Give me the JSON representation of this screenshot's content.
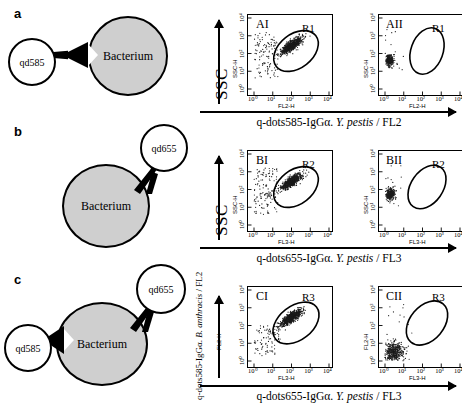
{
  "figure": {
    "panels": [
      {
        "letter": "a",
        "schematic": {
          "bacterium_label": "Bacterium",
          "qdots": [
            "qd585"
          ]
        },
        "y_axis_banner": "SSC",
        "y_axis_name": "SSC-H",
        "x_axis_caption": {
          "prefix": "q-dots585-IgG",
          "alpha": "α",
          "sep": ". ",
          "organism": "Y. pestis",
          "suffix": " / FL2"
        },
        "x_axis_name": "FL2-H",
        "ticks": [
          "10⁰",
          "10¹",
          "10²",
          "10³",
          "10⁴"
        ],
        "plots": [
          {
            "label": "AI",
            "gate": "R2",
            "gate_name_display": "R1",
            "populated": true
          },
          {
            "label": "AII",
            "gate": "R1",
            "gate_name_display": "R1",
            "populated": false
          }
        ]
      },
      {
        "letter": "b",
        "schematic": {
          "bacterium_label": "Bacterium",
          "qdots": [
            "qd655"
          ]
        },
        "y_axis_banner": "SSC",
        "y_axis_name": "SSC-H",
        "x_axis_caption": {
          "prefix": "q-dots655-IgG",
          "alpha": "α",
          "sep": ". ",
          "organism": "Y. pestis",
          "suffix": " / FL3"
        },
        "x_axis_name": "FL3-H",
        "ticks": [
          "10⁰",
          "10¹",
          "10²",
          "10³",
          "10⁴"
        ],
        "plots": [
          {
            "label": "BI",
            "gate": "R2",
            "gate_name_display": "R2",
            "populated": true
          },
          {
            "label": "BII",
            "gate": "R2",
            "gate_name_display": "R2",
            "populated": false
          }
        ]
      },
      {
        "letter": "c",
        "schematic": {
          "bacterium_label": "Bacterium",
          "qdots": [
            "qd585",
            "qd655"
          ]
        },
        "y_axis_banner_parts": {
          "prefix": "q-dots585-IgG",
          "alpha": "α",
          "sep": ". ",
          "organism": "B. anthracis",
          "suffix": " / FL2"
        },
        "y_axis_name": "FL2-H",
        "x_axis_caption": {
          "prefix": "q-dots655-IgG",
          "alpha": "α",
          "sep": ". ",
          "organism": "Y. pestis",
          "suffix": " / FL3"
        },
        "x_axis_name": "FL3-H",
        "ticks": [
          "10⁰",
          "10¹",
          "10²",
          "10³",
          "10⁴"
        ],
        "plots": [
          {
            "label": "CI",
            "gate": "R3",
            "gate_name_display": "R3",
            "populated": true
          },
          {
            "label": "CII",
            "gate": "R3",
            "gate_name_display": "R3",
            "populated": false
          }
        ]
      }
    ]
  },
  "chart_data": {
    "type": "scatter",
    "axis_scale": "log",
    "xlim": [
      1,
      10000
    ],
    "ylim": [
      1,
      10000
    ],
    "tick_labels": [
      "10⁰",
      "10¹",
      "10²",
      "10³",
      "10⁴"
    ],
    "grid": false,
    "legend": "none",
    "plots": [
      {
        "id": "AI",
        "xlabel": "FL2-H",
        "ylabel": "SSC-H",
        "gate": "R1",
        "gate_center_log": [
          2.1,
          2.5
        ],
        "main_cluster_log_center": [
          2.0,
          2.45
        ],
        "main_cluster_points": 620,
        "background_points": 120,
        "gate_populated": true
      },
      {
        "id": "AII",
        "xlabel": "FL2-H",
        "ylabel": "SSC-H",
        "gate": "R1",
        "gate_center_log": [
          2.1,
          2.5
        ],
        "main_cluster_log_center": [
          0.25,
          1.6
        ],
        "main_cluster_points": 260,
        "background_points": 15,
        "gate_populated": false
      },
      {
        "id": "BI",
        "xlabel": "FL3-H",
        "ylabel": "SSC-H",
        "gate": "R2",
        "gate_center_log": [
          2.1,
          2.5
        ],
        "main_cluster_log_center": [
          2.0,
          2.45
        ],
        "main_cluster_points": 600,
        "background_points": 130,
        "gate_populated": true
      },
      {
        "id": "BII",
        "xlabel": "FL3-H",
        "ylabel": "SSC-H",
        "gate": "R2",
        "gate_center_log": [
          2.1,
          2.5
        ],
        "main_cluster_log_center": [
          0.3,
          1.75
        ],
        "main_cluster_points": 280,
        "background_points": 12,
        "gate_populated": false
      },
      {
        "id": "CI",
        "xlabel": "FL3-H",
        "ylabel": "FL2-H",
        "gate": "R3",
        "gate_center_log": [
          2.1,
          2.5
        ],
        "main_cluster_log_center": [
          2.0,
          2.45
        ],
        "main_cluster_points": 640,
        "background_points": 90,
        "gate_populated": true
      },
      {
        "id": "CII",
        "xlabel": "FL3-H",
        "ylabel": "FL2-H",
        "gate": "R3",
        "gate_center_log": [
          2.1,
          2.5
        ],
        "main_cluster_log_center": [
          0.45,
          0.5
        ],
        "main_cluster_points": 420,
        "background_points": 14,
        "gate_populated": false
      }
    ]
  }
}
